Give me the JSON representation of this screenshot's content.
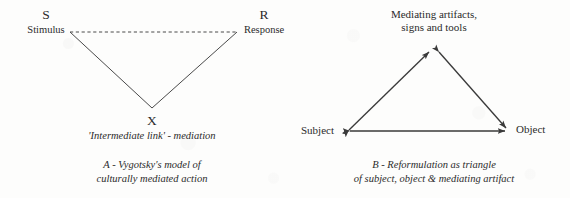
{
  "figure": {
    "background_color": "#fdfdfc",
    "ink_color": "#3a3a3a"
  },
  "panel_a": {
    "stimulus_letter": "S",
    "stimulus_word": "Stimulus",
    "response_letter": "R",
    "response_word": "Response",
    "apex_letter": "X",
    "apex_note": "'Intermediate link' - mediation",
    "caption_line1": "A - Vygotsky's model of",
    "caption_line2": "culturally mediated action"
  },
  "panel_b": {
    "top_line1": "Mediating artifacts,",
    "top_line2": "signs and tools",
    "subject_label": "Subject",
    "object_label": "Object",
    "caption_line1": "B - Reformulation as triangle",
    "caption_line2": "of subject, object & mediating artifact"
  }
}
